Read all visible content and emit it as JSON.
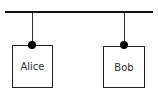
{
  "diagram": {
    "bus": {
      "label": ""
    },
    "nodes": [
      {
        "label": "Alice"
      },
      {
        "label": "Bob"
      }
    ]
  }
}
